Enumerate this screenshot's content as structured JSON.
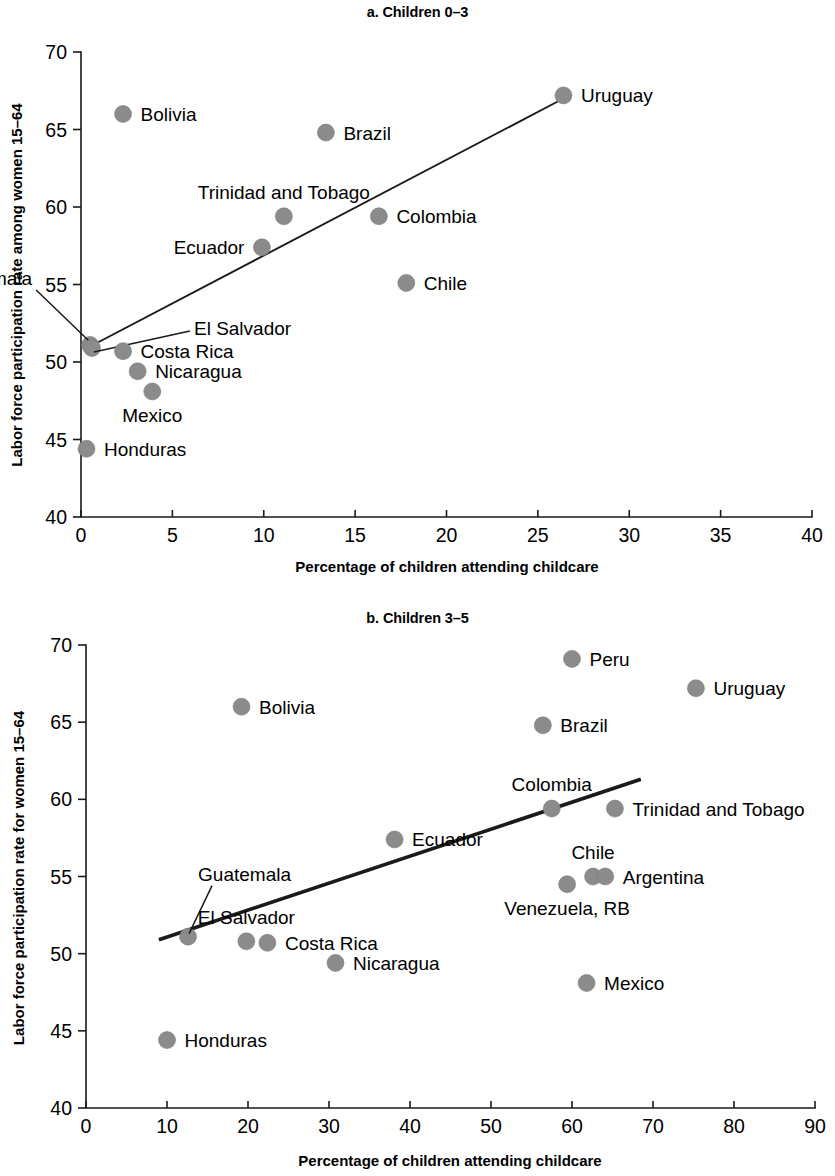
{
  "figure": {
    "panels": [
      {
        "id": "a",
        "title": "a. Children 0–3",
        "x_axis_title": "Percentage of children attending childcare",
        "y_axis_title": "Labor force participation rate among women 15–64"
      },
      {
        "id": "b",
        "title": "b. Children 3–5",
        "x_axis_title": "Percentage of children attending childcare",
        "y_axis_title": "Labor force participation rate for women 15–64"
      }
    ]
  },
  "chart_data": [
    {
      "type": "scatter",
      "panel": "a",
      "title": "a. Children 0–3",
      "xlabel": "Percentage of children attending childcare",
      "ylabel": "Labor force participation rate among women 15–64",
      "xlim": [
        0,
        40
      ],
      "ylim": [
        40,
        70
      ],
      "xticks": [
        0,
        5,
        10,
        15,
        20,
        25,
        30,
        35,
        40
      ],
      "yticks": [
        40,
        45,
        50,
        55,
        60,
        65,
        70
      ],
      "xtick_labels": [
        "0",
        "5",
        "10",
        "15",
        "20",
        "25",
        "30",
        "35",
        "40"
      ],
      "ytick_labels": [
        "40",
        "45",
        "50",
        "55",
        "60",
        "65",
        "70"
      ],
      "grid": false,
      "legend": "none",
      "points": [
        {
          "label": "Uruguay",
          "x": 26.4,
          "y": 67.2,
          "label_pos": "right"
        },
        {
          "label": "Bolivia",
          "x": 2.3,
          "y": 66.0,
          "label_pos": "right"
        },
        {
          "label": "Brazil",
          "x": 13.4,
          "y": 64.8,
          "label_pos": "right"
        },
        {
          "label": "Trinidad and Tobago",
          "x": 11.1,
          "y": 59.4,
          "label_pos": "above"
        },
        {
          "label": "Colombia",
          "x": 16.3,
          "y": 59.4,
          "label_pos": "right"
        },
        {
          "label": "Ecuador",
          "x": 9.9,
          "y": 57.4,
          "label_pos": "left"
        },
        {
          "label": "Chile",
          "x": 17.8,
          "y": 55.1,
          "label_pos": "right"
        },
        {
          "label": "Guatemala",
          "x": 0.5,
          "y": 51.1,
          "label_pos": "leader-upper-left"
        },
        {
          "label": "El Salvador",
          "x": 0.6,
          "y": 50.9,
          "label_pos": "leader-right"
        },
        {
          "label": "Costa Rica",
          "x": 2.3,
          "y": 50.7,
          "label_pos": "right"
        },
        {
          "label": "Nicaragua",
          "x": 3.1,
          "y": 49.4,
          "label_pos": "right"
        },
        {
          "label": "Mexico",
          "x": 3.9,
          "y": 48.1,
          "label_pos": "below"
        },
        {
          "label": "Honduras",
          "x": 0.3,
          "y": 44.4,
          "label_pos": "right"
        }
      ],
      "trend_line": {
        "x0": 0.5,
        "y0": 51.0,
        "x1": 26.4,
        "y1": 67.0
      }
    },
    {
      "type": "scatter",
      "panel": "b",
      "title": "b. Children 3–5",
      "xlabel": "Percentage of children attending childcare",
      "ylabel": "Labor force participation rate for women 15–64",
      "xlim": [
        0,
        90
      ],
      "ylim": [
        40,
        70
      ],
      "xticks": [
        0,
        10,
        20,
        30,
        40,
        50,
        60,
        70,
        80,
        90
      ],
      "yticks": [
        40,
        45,
        50,
        55,
        60,
        65,
        70
      ],
      "xtick_labels": [
        "0",
        "10",
        "20",
        "30",
        "40",
        "50",
        "60",
        "70",
        "80",
        "90"
      ],
      "ytick_labels": [
        "40",
        "45",
        "50",
        "55",
        "60",
        "65",
        "70"
      ],
      "grid": false,
      "legend": "none",
      "points": [
        {
          "label": "Peru",
          "x": 60.0,
          "y": 69.1,
          "label_pos": "right"
        },
        {
          "label": "Uruguay",
          "x": 75.3,
          "y": 67.2,
          "label_pos": "right"
        },
        {
          "label": "Bolivia",
          "x": 19.2,
          "y": 66.0,
          "label_pos": "right"
        },
        {
          "label": "Brazil",
          "x": 56.4,
          "y": 64.8,
          "label_pos": "right"
        },
        {
          "label": "Colombia",
          "x": 57.5,
          "y": 59.4,
          "label_pos": "above"
        },
        {
          "label": "Trinidad and Tobago",
          "x": 65.3,
          "y": 59.4,
          "label_pos": "right"
        },
        {
          "label": "Ecuador",
          "x": 38.1,
          "y": 57.4,
          "label_pos": "right"
        },
        {
          "label": "Chile",
          "x": 62.6,
          "y": 55.0,
          "label_pos": "above"
        },
        {
          "label": "Argentina",
          "x": 64.1,
          "y": 55.0,
          "label_pos": "right"
        },
        {
          "label": "Venezuela, RB",
          "x": 59.4,
          "y": 54.5,
          "label_pos": "below"
        },
        {
          "label": "Guatemala",
          "x": 12.6,
          "y": 51.1,
          "label_pos": "leader-upper-right"
        },
        {
          "label": "El Salvador",
          "x": 19.8,
          "y": 50.8,
          "label_pos": "above"
        },
        {
          "label": "Costa Rica",
          "x": 22.4,
          "y": 50.7,
          "label_pos": "right"
        },
        {
          "label": "Nicaragua",
          "x": 30.8,
          "y": 49.4,
          "label_pos": "right"
        },
        {
          "label": "Mexico",
          "x": 61.8,
          "y": 48.1,
          "label_pos": "right"
        },
        {
          "label": "Honduras",
          "x": 10.0,
          "y": 44.4,
          "label_pos": "right"
        }
      ],
      "trend_line": {
        "x0": 9.0,
        "y0": 50.9,
        "x1": 68.5,
        "y1": 61.3
      }
    }
  ],
  "style": {
    "marker_color": "#8b8b8b",
    "axis_color": "#1a1a1a",
    "trend_color": "#1a1a1a",
    "background": "#ffffff"
  }
}
